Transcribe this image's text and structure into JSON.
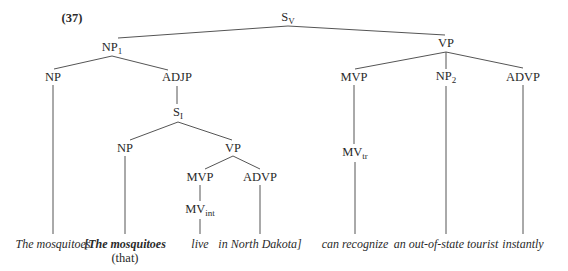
{
  "example_number": "(37)",
  "nodes": {
    "sv": {
      "base": "S",
      "sub": "V",
      "x": 288,
      "y": 18
    },
    "np1": {
      "base": "NP",
      "sub": "1",
      "x": 112,
      "y": 48
    },
    "np_a": {
      "base": "NP",
      "sub": "",
      "x": 53,
      "y": 77
    },
    "adjp": {
      "base": "ADJP",
      "sub": "",
      "x": 177,
      "y": 77
    },
    "si": {
      "base": "S",
      "sub": "I",
      "x": 178,
      "y": 113
    },
    "np_b": {
      "base": "NP",
      "sub": "",
      "x": 125,
      "y": 148
    },
    "vp_inner": {
      "base": "VP",
      "sub": "",
      "x": 233,
      "y": 148
    },
    "mvp_inner": {
      "base": "MVP",
      "sub": "",
      "x": 200,
      "y": 177
    },
    "advp_inner": {
      "base": "ADVP",
      "sub": "",
      "x": 260,
      "y": 177
    },
    "mv_int": {
      "base": "MV",
      "sub": "int",
      "x": 200,
      "y": 210
    },
    "vp": {
      "base": "VP",
      "sub": "",
      "x": 446,
      "y": 43
    },
    "mvp": {
      "base": "MVP",
      "sub": "",
      "x": 354,
      "y": 77
    },
    "np2": {
      "base": "NP",
      "sub": "2",
      "x": 446,
      "y": 77
    },
    "advp": {
      "base": "ADVP",
      "sub": "",
      "x": 523,
      "y": 77
    },
    "mv_tr": {
      "base": "MV",
      "sub": "tr",
      "x": 355,
      "y": 153
    }
  },
  "leaves": [
    {
      "text": "The mosquitoes",
      "x": 53,
      "y": 244,
      "bold": false
    },
    {
      "text": "[The mosquitoes",
      "x": 125,
      "y": 244,
      "bold": true
    },
    {
      "text": "live",
      "x": 200,
      "y": 244,
      "bold": false
    },
    {
      "text": "in North Dakota]",
      "x": 260,
      "y": 244,
      "bold": false
    },
    {
      "text": "can recognize",
      "x": 355,
      "y": 244,
      "bold": false
    },
    {
      "text": "an out-of-state tourist",
      "x": 446,
      "y": 244,
      "bold": false
    },
    {
      "text": "instantly",
      "x": 523,
      "y": 244,
      "bold": false
    }
  ],
  "annotation": {
    "text": "(that)",
    "x": 125,
    "y": 258
  },
  "edges": [
    [
      288,
      26,
      118,
      38
    ],
    [
      288,
      26,
      445,
      35
    ],
    [
      112,
      56,
      54,
      69
    ],
    [
      112,
      56,
      168,
      70
    ],
    [
      177,
      86,
      177,
      104
    ],
    [
      178,
      122,
      130,
      140
    ],
    [
      178,
      122,
      232,
      140
    ],
    [
      53,
      85,
      53,
      234
    ],
    [
      125,
      156,
      125,
      234
    ],
    [
      233,
      156,
      205,
      169
    ],
    [
      233,
      156,
      260,
      169
    ],
    [
      200,
      185,
      200,
      201
    ],
    [
      200,
      219,
      200,
      234
    ],
    [
      260,
      185,
      260,
      234
    ],
    [
      446,
      52,
      355,
      69
    ],
    [
      446,
      52,
      446,
      69
    ],
    [
      446,
      52,
      523,
      68
    ],
    [
      354,
      85,
      354,
      144
    ],
    [
      355,
      162,
      355,
      234
    ],
    [
      446,
      86,
      446,
      234
    ],
    [
      523,
      85,
      523,
      234
    ]
  ],
  "colors": {
    "line": "#555555",
    "text": "#2a2a2a",
    "background": "#ffffff"
  }
}
